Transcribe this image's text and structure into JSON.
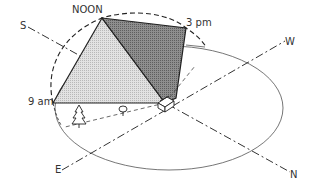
{
  "diagram": {
    "type": "sun-path-shading",
    "labels": {
      "noon": "NOON",
      "three_pm": "3 pm",
      "nine_am": "9 am",
      "south": "S",
      "west": "W",
      "east": "E",
      "north": "N"
    },
    "colors": {
      "morning_shade": "#d6d6d6",
      "afternoon_shade": "#8a8a8a",
      "line": "#222222",
      "horizon": "#555555"
    }
  }
}
